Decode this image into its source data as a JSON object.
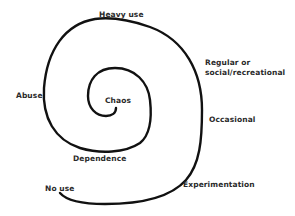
{
  "diagram": {
    "type": "spiral",
    "line_color": "#111111",
    "text_color": "#2a2a2a",
    "stages": [
      {
        "label": "No use"
      },
      {
        "label": "Experimentation"
      },
      {
        "label": "Occasional"
      },
      {
        "label": "Regular or social/recreational",
        "lines": [
          "Regular or",
          "social/recreational"
        ]
      },
      {
        "label": "Heavy use"
      },
      {
        "label": "Abuse"
      },
      {
        "label": "Dependence"
      },
      {
        "label": "Chaos"
      }
    ]
  }
}
